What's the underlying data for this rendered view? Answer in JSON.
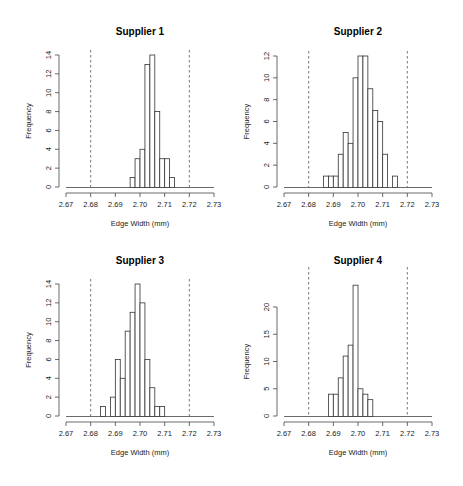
{
  "figure": {
    "layout": "2x2 grid of histograms",
    "spec_limits": [
      2.68,
      2.72
    ],
    "spec_line_style": "dashed"
  },
  "chart_data": [
    {
      "type": "bar",
      "subtype": "histogram",
      "title": "Supplier 1",
      "xlabel": "Edge Width (mm)",
      "ylabel": "Frequency",
      "xlim": [
        2.67,
        2.73
      ],
      "xticks": [
        "2.67",
        "2.68",
        "2.69",
        "2.70",
        "2.71",
        "2.72",
        "2.73"
      ],
      "ylim": [
        0,
        14
      ],
      "yticks": [
        "0",
        "2",
        "4",
        "6",
        "8",
        "10",
        "12",
        "14"
      ],
      "bin_width": 0.002,
      "bin_start": 2.696,
      "values": [
        1,
        3,
        4,
        13,
        14,
        8,
        3,
        3,
        1
      ],
      "reference_lines": [
        2.68,
        2.72
      ],
      "grid": false
    },
    {
      "type": "bar",
      "subtype": "histogram",
      "title": "Supplier 2",
      "xlabel": "Edge Width (mm)",
      "ylabel": "Frequency",
      "xlim": [
        2.67,
        2.73
      ],
      "xticks": [
        "2.67",
        "2.68",
        "2.69",
        "2.70",
        "2.71",
        "2.72",
        "2.73"
      ],
      "ylim": [
        0,
        12
      ],
      "yticks": [
        "0",
        "2",
        "4",
        "6",
        "8",
        "10",
        "12"
      ],
      "bin_width": 0.002,
      "bin_start": 2.686,
      "values": [
        1,
        1,
        1,
        3,
        5,
        4,
        10,
        12,
        12,
        9,
        7,
        6,
        3,
        0,
        1
      ],
      "reference_lines": [
        2.68,
        2.72
      ],
      "grid": false
    },
    {
      "type": "bar",
      "subtype": "histogram",
      "title": "Supplier 3",
      "xlabel": "Edge Width (mm)",
      "ylabel": "Frequency",
      "xlim": [
        2.67,
        2.73
      ],
      "xticks": [
        "2.67",
        "2.68",
        "2.69",
        "2.70",
        "2.71",
        "2.72",
        "2.73"
      ],
      "ylim": [
        0,
        14
      ],
      "yticks": [
        "0",
        "2",
        "4",
        "6",
        "8",
        "10",
        "12",
        "14"
      ],
      "bin_width": 0.002,
      "bin_start": 2.684,
      "values": [
        1,
        0,
        2,
        6,
        4,
        9,
        11,
        14,
        12,
        6,
        3,
        1,
        1
      ],
      "reference_lines": [
        2.68,
        2.72
      ],
      "grid": false
    },
    {
      "type": "bar",
      "subtype": "histogram",
      "title": "Supplier 4",
      "xlabel": "Edge Width (mm)",
      "ylabel": "Frequency",
      "xlim": [
        2.67,
        2.73
      ],
      "xticks": [
        "2.67",
        "2.68",
        "2.69",
        "2.70",
        "2.71",
        "2.72",
        "2.73"
      ],
      "ylim": [
        0,
        20
      ],
      "yticks": [
        "0",
        "5",
        "10",
        "15",
        "20"
      ],
      "bin_width": 0.002,
      "bin_start": 2.688,
      "values": [
        4,
        4,
        7,
        11,
        13,
        24,
        5,
        4,
        3
      ],
      "reference_lines": [
        2.68,
        2.72
      ],
      "grid": false
    }
  ]
}
